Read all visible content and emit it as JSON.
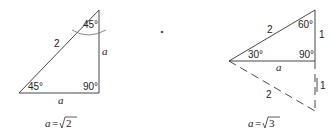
{
  "diagram": {
    "left_triangle": {
      "name": "45-45-90 triangle",
      "hypotenuse_label": "2",
      "vertical_leg_label": "a",
      "horizontal_leg_label": "a",
      "top_angle": "45°",
      "bottom_left_angle": "45°",
      "right_angle": "90°",
      "equation_var": "a",
      "equation_eq": "=",
      "equation_radicand": "2"
    },
    "right_triangle": {
      "name": "30-60-90 triangle",
      "upper_hypotenuse_label": "2",
      "lower_hypotenuse_label": "2",
      "upper_vertical_label": "1",
      "lower_vertical_label": "1",
      "horizontal_label": "a",
      "top_angle": "60°",
      "left_angle": "30°",
      "right_angle": "90°",
      "equation_var": "a",
      "equation_eq": "=",
      "equation_radicand": "3"
    },
    "stroke_color": "#333333"
  }
}
